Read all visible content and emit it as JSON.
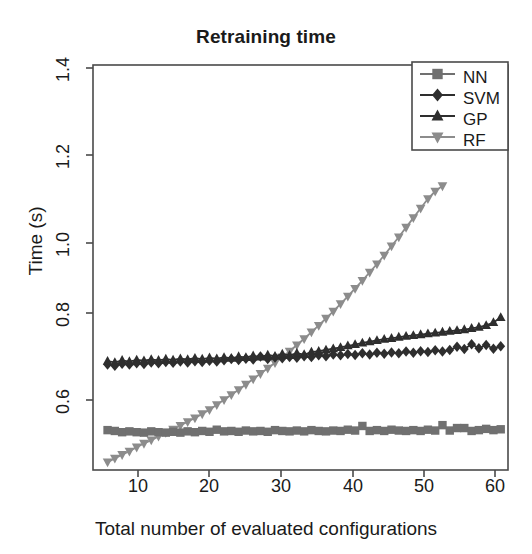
{
  "chart_data": {
    "type": "line",
    "title": "Retraining time",
    "xlabel": "Total number of evaluated configurations",
    "ylabel": "Time (s)",
    "xlim": [
      4,
      61
    ],
    "ylim": [
      0.455,
      1.43
    ],
    "xticks": [
      10,
      20,
      30,
      40,
      50,
      60
    ],
    "yticks": [
      0.6,
      0.8,
      1.0,
      1.2,
      1.4
    ],
    "ytick_labels": [
      "0.6",
      "0.8",
      "1.0",
      "1.2",
      "1.4"
    ],
    "xtick_labels": [
      "10",
      "20",
      "30",
      "40",
      "50",
      "60"
    ],
    "grid": false,
    "legend_position": "top-right",
    "series": [
      {
        "name": "NN",
        "marker": "square",
        "color": "#707070",
        "x": [
          6,
          7,
          8,
          9,
          10,
          11,
          12,
          13,
          14,
          15,
          16,
          17,
          18,
          19,
          20,
          21,
          22,
          23,
          24,
          25,
          26,
          27,
          28,
          29,
          30,
          31,
          32,
          33,
          34,
          35,
          36,
          37,
          38,
          39,
          40,
          41,
          42,
          43,
          44,
          45,
          46,
          47,
          48,
          49,
          50,
          51,
          52,
          53,
          54,
          55,
          56,
          57,
          58,
          59,
          60
        ],
        "y": [
          0.551,
          0.549,
          0.546,
          0.548,
          0.546,
          0.545,
          0.548,
          0.546,
          0.545,
          0.547,
          0.545,
          0.548,
          0.546,
          0.549,
          0.547,
          0.552,
          0.548,
          0.549,
          0.547,
          0.55,
          0.548,
          0.549,
          0.547,
          0.551,
          0.549,
          0.548,
          0.55,
          0.548,
          0.551,
          0.549,
          0.548,
          0.55,
          0.549,
          0.552,
          0.55,
          0.561,
          0.549,
          0.551,
          0.549,
          0.552,
          0.55,
          0.549,
          0.551,
          0.549,
          0.552,
          0.55,
          0.563,
          0.55,
          0.556,
          0.556,
          0.549,
          0.551,
          0.554,
          0.551,
          0.553
        ]
      },
      {
        "name": "SVM",
        "marker": "diamond",
        "color": "#2e2e2e",
        "x": [
          6,
          7,
          8,
          9,
          10,
          11,
          12,
          13,
          14,
          15,
          16,
          17,
          18,
          19,
          20,
          21,
          22,
          23,
          24,
          25,
          26,
          27,
          28,
          29,
          30,
          31,
          32,
          33,
          34,
          35,
          36,
          37,
          38,
          39,
          40,
          41,
          42,
          43,
          44,
          45,
          46,
          47,
          48,
          49,
          50,
          51,
          52,
          53,
          54,
          55,
          56,
          57,
          58,
          59,
          60
        ],
        "y": [
          0.709,
          0.706,
          0.711,
          0.709,
          0.712,
          0.71,
          0.714,
          0.712,
          0.715,
          0.713,
          0.716,
          0.714,
          0.717,
          0.715,
          0.718,
          0.716,
          0.719,
          0.722,
          0.72,
          0.723,
          0.721,
          0.728,
          0.722,
          0.726,
          0.724,
          0.727,
          0.725,
          0.729,
          0.727,
          0.731,
          0.729,
          0.733,
          0.731,
          0.734,
          0.732,
          0.736,
          0.733,
          0.737,
          0.735,
          0.738,
          0.736,
          0.74,
          0.737,
          0.741,
          0.739,
          0.743,
          0.74,
          0.744,
          0.752,
          0.746,
          0.758,
          0.748,
          0.756,
          0.747,
          0.753
        ]
      },
      {
        "name": "GP",
        "marker": "triangle-up",
        "color": "#2e2e2e",
        "x": [
          6,
          7,
          8,
          9,
          10,
          11,
          12,
          13,
          14,
          15,
          16,
          17,
          18,
          19,
          20,
          21,
          22,
          23,
          24,
          25,
          26,
          27,
          28,
          29,
          30,
          31,
          32,
          33,
          34,
          35,
          36,
          37,
          38,
          39,
          40,
          41,
          42,
          43,
          44,
          45,
          46,
          47,
          48,
          49,
          50,
          51,
          52,
          53,
          54,
          55,
          56,
          57,
          58,
          59,
          60
        ],
        "y": [
          0.717,
          0.714,
          0.719,
          0.716,
          0.72,
          0.718,
          0.721,
          0.719,
          0.722,
          0.72,
          0.723,
          0.721,
          0.724,
          0.722,
          0.725,
          0.723,
          0.726,
          0.724,
          0.728,
          0.726,
          0.73,
          0.727,
          0.732,
          0.729,
          0.734,
          0.731,
          0.736,
          0.733,
          0.739,
          0.741,
          0.744,
          0.747,
          0.75,
          0.754,
          0.757,
          0.761,
          0.764,
          0.767,
          0.77,
          0.772,
          0.775,
          0.777,
          0.779,
          0.781,
          0.783,
          0.785,
          0.787,
          0.789,
          0.791,
          0.793,
          0.796,
          0.799,
          0.803,
          0.81,
          0.822
        ]
      },
      {
        "name": "RF",
        "marker": "triangle-down",
        "color": "#8c8c8c",
        "x": [
          6,
          7,
          8,
          9,
          10,
          11,
          12,
          13,
          14,
          15,
          16,
          17,
          18,
          19,
          20,
          21,
          22,
          23,
          24,
          25,
          26,
          27,
          28,
          29,
          30,
          31,
          32,
          33,
          34,
          35,
          36,
          37,
          38,
          39,
          40,
          41,
          42,
          43,
          44,
          45,
          46,
          47,
          48,
          49,
          50,
          51,
          52
        ],
        "y": [
          0.474,
          0.483,
          0.492,
          0.5,
          0.51,
          0.519,
          0.527,
          0.536,
          0.545,
          0.553,
          0.562,
          0.571,
          0.58,
          0.59,
          0.6,
          0.612,
          0.624,
          0.636,
          0.648,
          0.661,
          0.674,
          0.687,
          0.7,
          0.713,
          0.727,
          0.741,
          0.756,
          0.771,
          0.787,
          0.803,
          0.82,
          0.837,
          0.855,
          0.873,
          0.892,
          0.911,
          0.931,
          0.951,
          0.972,
          0.994,
          1.016,
          1.039,
          1.062,
          1.085,
          1.108,
          1.126,
          1.139
        ]
      }
    ]
  },
  "legend": {
    "items": [
      {
        "label": "NN"
      },
      {
        "label": "SVM"
      },
      {
        "label": "GP"
      },
      {
        "label": "RF"
      }
    ]
  }
}
